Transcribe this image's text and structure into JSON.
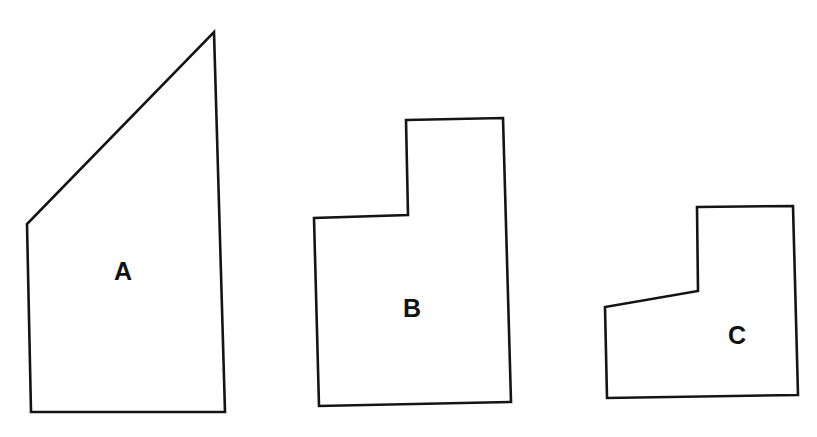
{
  "figure": {
    "background_color": "#ffffff",
    "stroke_color": "#141414",
    "label_color": "#111111",
    "canvas": {
      "width": 817,
      "height": 437
    }
  },
  "chart_data": {
    "type": "diagram",
    "title": "",
    "xlabel": "",
    "ylabel": "",
    "grid": false,
    "legend": false,
    "shapes": [
      {
        "id": "A",
        "label": "A",
        "kind": "quadrilateral",
        "vertex_count": 4,
        "points": "214,32 225,412 31,412 27,224",
        "vertices": [
          [
            214,
            32
          ],
          [
            225,
            412
          ],
          [
            31,
            412
          ],
          [
            27,
            224
          ]
        ],
        "label_position": [
          123,
          271
        ],
        "bbox": [
          27,
          32,
          225,
          412
        ]
      },
      {
        "id": "B",
        "label": "B",
        "kind": "L-shaped hexagon",
        "vertex_count": 6,
        "points": "406,120 503,118 511,402 319,406 314,218 408,215",
        "vertices": [
          [
            406,
            120
          ],
          [
            503,
            118
          ],
          [
            511,
            402
          ],
          [
            319,
            406
          ],
          [
            314,
            218
          ],
          [
            408,
            215
          ]
        ],
        "label_position": [
          412,
          308
        ],
        "bbox": [
          314,
          118,
          511,
          406
        ]
      },
      {
        "id": "C",
        "label": "C",
        "kind": "L-shaped hexagon",
        "vertex_count": 6,
        "points": "697,207 793,206 798,395 607,398 605,307 698,291",
        "vertices": [
          [
            697,
            207
          ],
          [
            793,
            206
          ],
          [
            798,
            395
          ],
          [
            607,
            398
          ],
          [
            605,
            307
          ],
          [
            698,
            291
          ]
        ],
        "label_position": [
          737,
          335
        ],
        "bbox": [
          605,
          206,
          798,
          398
        ]
      }
    ]
  }
}
